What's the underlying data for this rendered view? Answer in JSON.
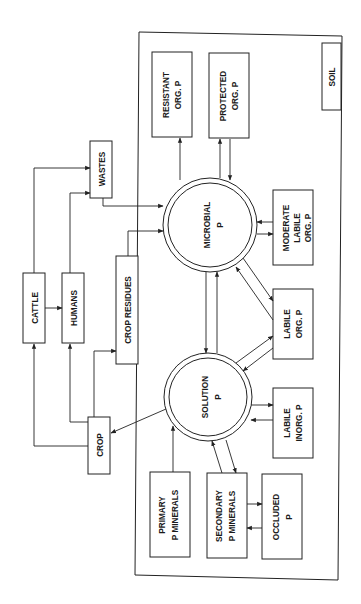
{
  "diagram": {
    "orientation": "rotated 90deg counter-clockwise",
    "container": {
      "label": "SOIL"
    },
    "pools": {
      "microbial": [
        "MICROBIAL",
        "P"
      ],
      "solution": [
        "SOLUTION",
        "P"
      ]
    },
    "boxes": {
      "resistant": [
        "RESISTANT",
        "ORG. P"
      ],
      "protected": [
        "PROTECTED",
        "ORG. P"
      ],
      "moderate": [
        "MODERATE",
        "LABILE",
        "ORG. P"
      ],
      "labile_org": [
        "LABILE",
        "ORG. P"
      ],
      "labile_inorg": [
        "LABILE",
        "INORG. P"
      ],
      "primary": [
        "PRIMARY",
        "P MINERALS"
      ],
      "secondary": [
        "SECONDARY",
        "P MINERALS"
      ],
      "occluded": [
        "OCCLUDED",
        "P"
      ],
      "cattle": "CATTLE",
      "humans": "HUMANS",
      "wastes": "WASTES",
      "crop_residues": "CROP RESIDUES",
      "crop": "CROP"
    },
    "flows": [
      {
        "from": "MICROBIAL P",
        "to": "RESISTANT ORG. P"
      },
      {
        "from": "MICROBIAL P",
        "to": "PROTECTED ORG. P"
      },
      {
        "from": "PROTECTED ORG. P",
        "to": "MICROBIAL P"
      },
      {
        "from": "MICROBIAL P",
        "to": "MODERATE LABILE ORG. P"
      },
      {
        "from": "MODERATE LABILE ORG. P",
        "to": "MICROBIAL P"
      },
      {
        "from": "MICROBIAL P",
        "to": "LABILE ORG. P"
      },
      {
        "from": "LABILE ORG. P",
        "to": "MICROBIAL P"
      },
      {
        "from": "MICROBIAL P",
        "to": "SOLUTION P"
      },
      {
        "from": "SOLUTION P",
        "to": "MICROBIAL P"
      },
      {
        "from": "SOLUTION P",
        "to": "LABILE ORG. P"
      },
      {
        "from": "LABILE ORG. P",
        "to": "SOLUTION P"
      },
      {
        "from": "SOLUTION P",
        "to": "LABILE INORG. P"
      },
      {
        "from": "LABILE INORG. P",
        "to": "SOLUTION P"
      },
      {
        "from": "PRIMARY P MINERALS",
        "to": "SOLUTION P"
      },
      {
        "from": "SOLUTION P",
        "to": "SECONDARY P MINERALS"
      },
      {
        "from": "SECONDARY P MINERALS",
        "to": "SOLUTION P"
      },
      {
        "from": "SECONDARY P MINERALS",
        "to": "OCCLUDED P"
      },
      {
        "from": "OCCLUDED P",
        "to": "SECONDARY P MINERALS"
      },
      {
        "from": "SOLUTION P",
        "to": "CROP"
      },
      {
        "from": "CROP",
        "to": "CATTLE"
      },
      {
        "from": "CROP",
        "to": "HUMANS"
      },
      {
        "from": "CROP",
        "to": "CROP RESIDUES"
      },
      {
        "from": "CATTLE",
        "to": "HUMANS"
      },
      {
        "from": "CATTLE",
        "to": "WASTES"
      },
      {
        "from": "HUMANS",
        "to": "WASTES"
      },
      {
        "from": "WASTES",
        "to": "MICROBIAL P"
      },
      {
        "from": "CROP RESIDUES",
        "to": "MICROBIAL P"
      }
    ]
  }
}
